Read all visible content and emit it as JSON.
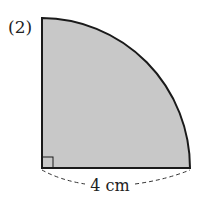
{
  "problem": {
    "number_label": "(2)",
    "dimension_label": "4 cm",
    "shape": "quarter circle (sector, 90°)",
    "radius": "4cm"
  },
  "colors": {
    "fill": "#c8c8c8",
    "stroke": "#1a1a1a",
    "background": "#ffffff"
  }
}
